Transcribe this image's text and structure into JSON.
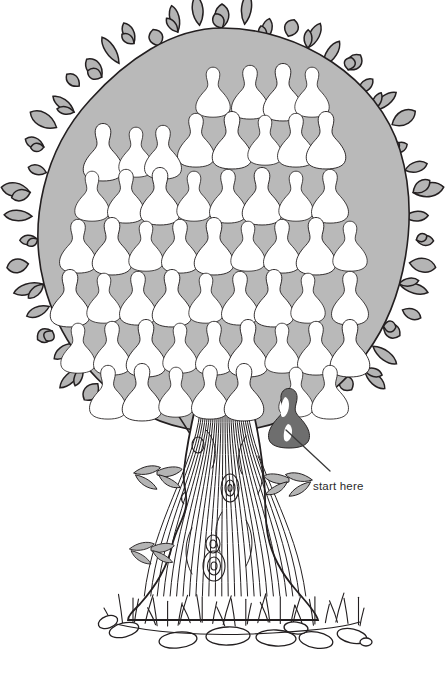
{
  "scene": {
    "title": "Pear Tree Counting Puzzle",
    "description": "Line drawing of a pear tree with a shaded canopy full of white pears, one shaded dark pear marked as the starting point, a wood-grain trunk, grass and stones at the base.",
    "canvas": {
      "width": 448,
      "height": 680
    }
  },
  "colors": {
    "background": "#ffffff",
    "ink": "#231f20",
    "canopy_fill": "#b9b9b9",
    "leaf_fill": "#b4b4b4",
    "pear_fill": "#ffffff",
    "start_pear_fill": "#6e6e6e",
    "start_pear_highlight": "#ffffff",
    "trunk_fill": "#ffffff",
    "stone_fill": "#ffffff",
    "label_color": "#2b2b2b"
  },
  "annotation": {
    "label": "start here",
    "label_x": 313,
    "label_y": 487,
    "pointer_from": {
      "x": 330,
      "y": 471
    },
    "pointer_to": {
      "x": 286,
      "y": 430
    }
  },
  "tree": {
    "canopy": {
      "center_x": 222,
      "center_y": 228,
      "radius_x": 190,
      "radius_y": 200,
      "leaf_tips": 54
    },
    "trunk": {
      "top_y": 400,
      "base_y": 615,
      "top_width": 70,
      "base_width": 130,
      "grain_lines": 26,
      "knots": 4
    },
    "ground": {
      "line_y": 620,
      "stones": 9,
      "grass_blades": 34
    },
    "trunk_sprigs": [
      {
        "x": 160,
        "y": 470,
        "flip": false
      },
      {
        "x": 266,
        "y": 478,
        "flip": true
      },
      {
        "x": 154,
        "y": 545,
        "flip": false
      },
      {
        "x": 181,
        "y": 432,
        "flip": false
      }
    ]
  },
  "pears": {
    "total_white": 54,
    "total_dark": 1,
    "rows": [
      {
        "row": 1,
        "y": 92,
        "count": 4,
        "xs": [
          213,
          250,
          283,
          312
        ]
      },
      {
        "row": 2,
        "y": 140,
        "count": 5,
        "xs": [
          196,
          232,
          265,
          296,
          326
        ]
      },
      {
        "row": 3,
        "y": 152,
        "count": 3,
        "xs": [
          103,
          136,
          163
        ]
      },
      {
        "row": 4,
        "y": 196,
        "count": 8,
        "xs": [
          92,
          126,
          160,
          194,
          228,
          262,
          296,
          330
        ]
      },
      {
        "row": 5,
        "y": 246,
        "count": 9,
        "xs": [
          78,
          112,
          146,
          180,
          214,
          248,
          282,
          316,
          350
        ]
      },
      {
        "row": 6,
        "y": 298,
        "count": 9,
        "xs": [
          70,
          104,
          138,
          172,
          206,
          240,
          274,
          308,
          350
        ]
      },
      {
        "row": 7,
        "y": 348,
        "count": 9,
        "xs": [
          78,
          112,
          146,
          180,
          214,
          248,
          282,
          316,
          350
        ]
      },
      {
        "row": 8,
        "y": 392,
        "count": 7,
        "xs": [
          108,
          142,
          176,
          210,
          244,
          296,
          330
        ]
      }
    ],
    "start_pear": {
      "x": 289,
      "y": 417,
      "width": 48,
      "height": 60,
      "shaded": true
    }
  }
}
